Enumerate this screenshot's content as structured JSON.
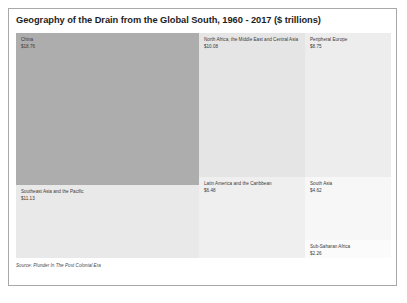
{
  "chart": {
    "title": "Geography of the Drain from the Global South, 1960 - 2017 ($ trillions)",
    "source": "Source: Plunder In The Post Colonial Era"
  },
  "chart_data": {
    "type": "treemap",
    "title": "Geography of the Drain from the Global South, 1960 - 2017 ($ trillions)",
    "unit": "$ trillions",
    "value_prefix": "$",
    "period": "1960 - 2017",
    "xlabel": "",
    "ylabel": "",
    "grid": false,
    "legend": "none",
    "categories": [
      "China",
      "Southeast Asia and the Pacific",
      "North Africa, the Middle East and Central Asia",
      "Latin America and the Caribbean",
      "Peripheral Europe",
      "South Asia",
      "Sub-Saharan Africa"
    ],
    "values": [
      18.76,
      11.13,
      10.08,
      6.48,
      8.75,
      4.62,
      2.26
    ],
    "tiles": [
      {
        "label": "China",
        "value": 18.76,
        "value_text": "$18.76",
        "color": "#adadad"
      },
      {
        "label": "Southeast Asia and the Pacific",
        "value": 11.13,
        "value_text": "$11.13",
        "color": "#e9e9e9"
      },
      {
        "label": "North Africa, the Middle East and Central Asia",
        "value": 10.08,
        "value_text": "$10.08",
        "color": "#e5e5e5"
      },
      {
        "label": "Latin America and the Caribbean",
        "value": 6.48,
        "value_text": "$6.48",
        "color": "#efefef"
      },
      {
        "label": "Peripheral Europe",
        "value": 8.75,
        "value_text": "$8.75",
        "color": "#ededed"
      },
      {
        "label": "South Asia",
        "value": 4.62,
        "value_text": "$4.62",
        "color": "#f7f7f7"
      },
      {
        "label": "Sub-Saharan Africa",
        "value": 2.26,
        "value_text": "$2.26",
        "color": "#fbfbfb"
      }
    ],
    "source": "Source: Plunder In The Post Colonial Era"
  }
}
